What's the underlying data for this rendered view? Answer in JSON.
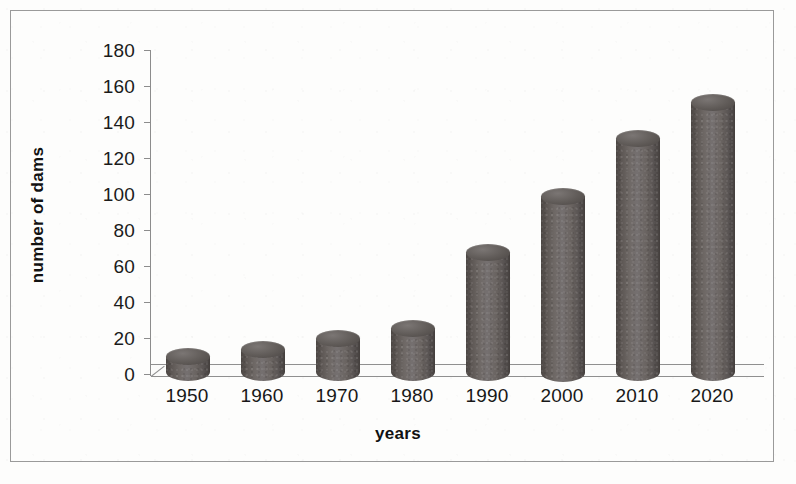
{
  "figure": {
    "border_color": "#9a9a9a",
    "background": "#fdfdfc"
  },
  "chart_data": {
    "type": "bar",
    "title": "",
    "subtitle": "",
    "xlabel": "years",
    "ylabel": "number of dams",
    "categories": [
      "1950",
      "1960",
      "1970",
      "1980",
      "1990",
      "2000",
      "2010",
      "2020"
    ],
    "values": [
      10,
      14,
      20,
      26,
      68,
      99,
      131,
      151
    ],
    "ylim": [
      0,
      180
    ],
    "ytick_values": [
      "180",
      "160",
      "140",
      "120",
      "100",
      "80",
      "60",
      "40",
      "20",
      "0"
    ],
    "ytick_step": 20,
    "grid": false,
    "legend": null,
    "series_color": "#615b58",
    "style": "3d-cylinder",
    "axis_color": "#8c8c8c"
  }
}
